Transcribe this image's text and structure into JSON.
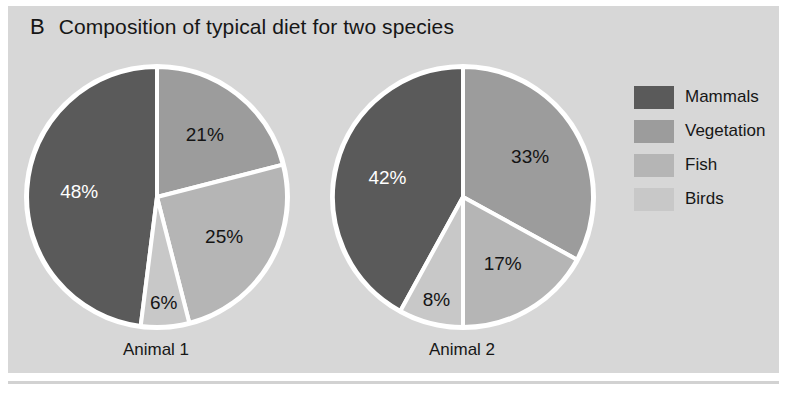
{
  "figure": {
    "panel_letter": "B",
    "title": "Composition of typical diet for two species",
    "background": "#d7d7d7"
  },
  "legend": {
    "position": "right",
    "items": [
      {
        "label": "Mammals",
        "color": "#5a5a5a"
      },
      {
        "label": "Vegetation",
        "color": "#9c9c9c"
      },
      {
        "label": "Fish",
        "color": "#b5b5b5"
      },
      {
        "label": "Birds",
        "color": "#c8c8c8"
      }
    ]
  },
  "pies": [
    {
      "name": "Animal 1",
      "labels": [
        "48%",
        "21%",
        "25%",
        "6%"
      ]
    },
    {
      "name": "Animal 2",
      "labels": [
        "42%",
        "33%",
        "17%",
        "8%"
      ]
    }
  ],
  "chart_data": {
    "type": "pie",
    "title": "Composition of typical diet for two species",
    "panel": "B",
    "categories": [
      "Mammals",
      "Vegetation",
      "Fish",
      "Birds"
    ],
    "colors": [
      "#5a5a5a",
      "#9c9c9c",
      "#b5b5b5",
      "#c8c8c8"
    ],
    "legend_position": "right",
    "series": [
      {
        "name": "Animal 1",
        "values": [
          48,
          21,
          25,
          6
        ]
      },
      {
        "name": "Animal 2",
        "values": [
          42,
          33,
          17,
          8
        ]
      }
    ],
    "value_labels": [
      [
        "48%",
        "21%",
        "25%",
        "6%"
      ],
      [
        "42%",
        "33%",
        "17%",
        "8%"
      ]
    ],
    "units": "percent",
    "grid": false,
    "xlabel": "",
    "ylabel": ""
  }
}
